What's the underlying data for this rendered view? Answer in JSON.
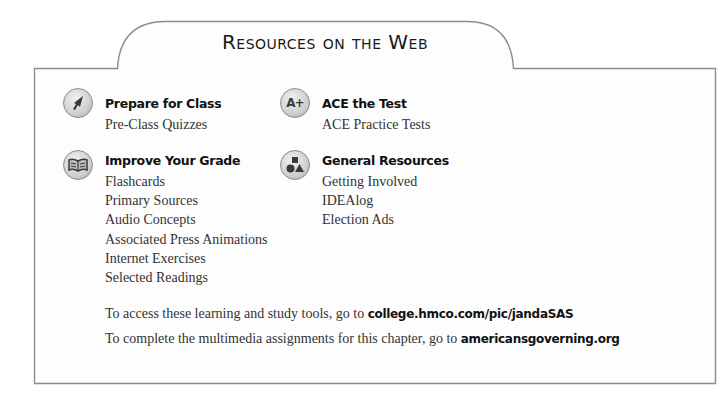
{
  "title": "Resources on the Web",
  "sections": [
    {
      "id": "prepare",
      "icon": "cursor-arrow-icon",
      "heading": "Prepare for Class",
      "items": [
        "Pre-Class Quizzes"
      ]
    },
    {
      "id": "ace",
      "icon": "a-plus-icon",
      "heading": "ACE the Test",
      "items": [
        "ACE Practice Tests"
      ]
    },
    {
      "id": "improve",
      "icon": "open-book-icon",
      "heading": "Improve Your Grade",
      "items": [
        "Flashcards",
        "Primary Sources",
        "Audio Concepts",
        "Associated Press Animations",
        "Internet Exercises",
        "Selected Readings"
      ]
    },
    {
      "id": "general",
      "icon": "shapes-icon",
      "heading": "General Resources",
      "items": [
        "Getting Involved",
        "IDEAlog",
        "Election Ads"
      ]
    }
  ],
  "notes": [
    {
      "text": "To access these learning and study tools, go to ",
      "link": "college.hmco.com/pic/jandaSAS"
    },
    {
      "text": "To complete the multimedia assignments for this chapter, go to ",
      "link": "americansgoverning.org"
    }
  ],
  "icon_glyphs": {
    "ace": "A+"
  },
  "colors": {
    "border": "#8c8c8c",
    "text": "#333333",
    "heading": "#111111"
  }
}
